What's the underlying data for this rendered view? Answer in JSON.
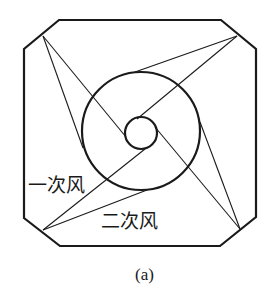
{
  "figure": {
    "caption": "(a)",
    "labels": {
      "primary_air": "一次风",
      "secondary_air": "二次风"
    },
    "colors": {
      "stroke": "#1a1a1a",
      "background": "#ffffff"
    },
    "furnace_outline": {
      "shape": "chamfered-square",
      "points": [
        [
          59,
          20
        ],
        [
          221,
          20
        ],
        [
          256,
          49
        ],
        [
          256,
          217
        ],
        [
          220,
          246
        ],
        [
          60,
          246
        ],
        [
          24,
          218
        ],
        [
          24,
          49
        ]
      ]
    },
    "burner_corners": [
      {
        "id": "top-left",
        "x": 43,
        "y": 36
      },
      {
        "id": "top-right",
        "x": 237,
        "y": 36
      },
      {
        "id": "bottom-right",
        "x": 240,
        "y": 229
      },
      {
        "id": "bottom-left",
        "x": 43,
        "y": 230
      }
    ],
    "circles": {
      "large": {
        "cx": 141,
        "cy": 131,
        "r": 59
      },
      "small": {
        "cx": 141,
        "cy": 133,
        "r": 16
      }
    },
    "jet_lines": [
      {
        "from": "top-left",
        "to": [
          83,
          148
        ]
      },
      {
        "from": "top-left",
        "to": [
          126,
          137
        ]
      },
      {
        "from": "top-right",
        "to": [
          135,
          72
        ]
      },
      {
        "from": "top-right",
        "to": [
          137,
          119
        ]
      },
      {
        "from": "bottom-right",
        "to": [
          200,
          122
        ]
      },
      {
        "from": "bottom-right",
        "to": [
          155,
          127
        ]
      },
      {
        "from": "bottom-left",
        "to": [
          147,
          190
        ]
      },
      {
        "from": "bottom-left",
        "to": [
          145,
          149
        ]
      }
    ]
  }
}
